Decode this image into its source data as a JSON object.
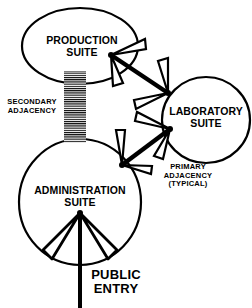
{
  "diagram": {
    "type": "adjacency-diagram",
    "nodes": [
      {
        "id": "production",
        "line1": "PRODUCTION",
        "line2": "SUITE"
      },
      {
        "id": "laboratory",
        "line1": "LABORATORY",
        "line2": "SUITE"
      },
      {
        "id": "administration",
        "line1": "ADMINISTRATION",
        "line2": "SUITE"
      }
    ],
    "annotations": {
      "secondary": {
        "line1": "SECONDARY",
        "line2": "ADJACENCY"
      },
      "primary": {
        "line1": "PRIMARY",
        "line2": "ADJACENCY",
        "line3": "(TYPICAL)"
      },
      "entry": {
        "line1": "PUBLIC",
        "line2": "ENTRY"
      }
    },
    "edges": [
      {
        "from": "production",
        "to": "laboratory",
        "type": "primary-adjacency"
      },
      {
        "from": "laboratory",
        "to": "administration",
        "type": "primary-adjacency"
      },
      {
        "from": "production",
        "to": "administration",
        "type": "secondary-adjacency"
      },
      {
        "from": "public-entry",
        "to": "administration",
        "type": "entry"
      }
    ],
    "colors": {
      "stroke": "#000000",
      "background": "#ffffff"
    }
  }
}
